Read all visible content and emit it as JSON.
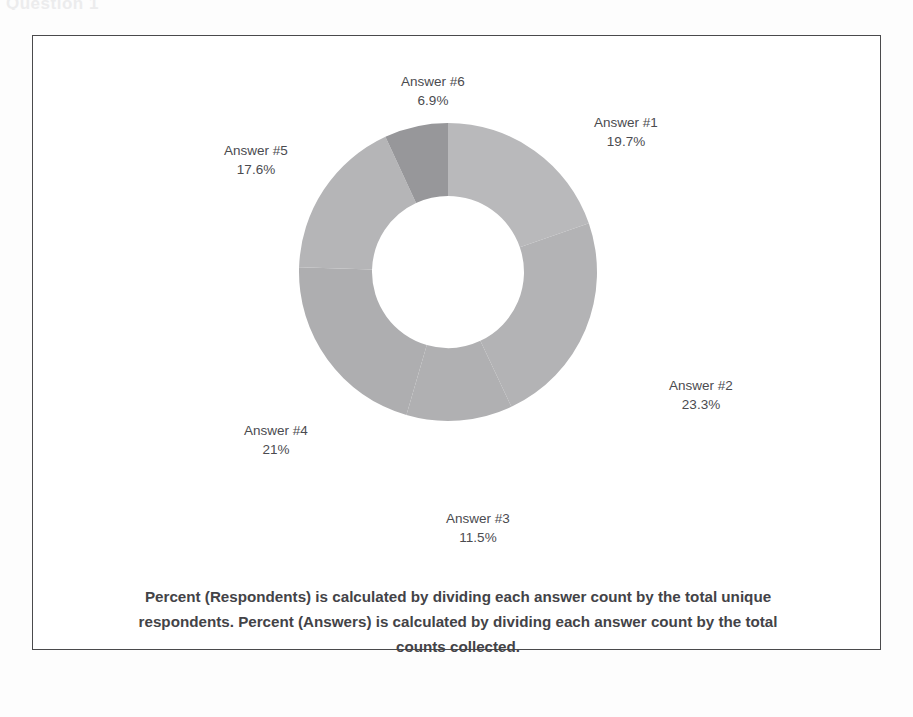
{
  "document": {
    "header_fragment": "Question 1"
  },
  "chart_data": {
    "type": "pie",
    "variant": "donut",
    "title": "",
    "xlabel": "",
    "ylabel": "",
    "legend_position": "none",
    "grid": false,
    "start_angle_deg": 0,
    "direction": "clockwise",
    "categories": [
      "Answer #1",
      "Answer #2",
      "Answer #3",
      "Answer #4",
      "Answer #5",
      "Answer #6"
    ],
    "values": [
      19.7,
      23.3,
      11.5,
      21,
      17.6,
      6.9
    ],
    "value_labels": [
      "19.7%",
      "23.3%",
      "11.5%",
      "21%",
      "17.6%",
      "6.9%"
    ],
    "unit": "%",
    "total": 100,
    "colors": [
      "#b9b9bb",
      "#b3b3b5",
      "#b0b0b2",
      "#aeaeb0",
      "#b5b5b7",
      "#97979a"
    ],
    "slices": [
      {
        "label": "Answer #1",
        "value": 19.7,
        "value_label": "19.7%",
        "color": "#b9b9bb"
      },
      {
        "label": "Answer #2",
        "value": 23.3,
        "value_label": "23.3%",
        "color": "#b3b3b5"
      },
      {
        "label": "Answer #3",
        "value": 11.5,
        "value_label": "11.5%",
        "color": "#b0b0b2"
      },
      {
        "label": "Answer #4",
        "value": 21,
        "value_label": "21%",
        "color": "#aeaeb0"
      },
      {
        "label": "Answer #5",
        "value": 17.6,
        "value_label": "17.6%",
        "color": "#b5b5b7"
      },
      {
        "label": "Answer #6",
        "value": 6.9,
        "value_label": "6.9%",
        "color": "#97979a"
      }
    ]
  },
  "caption": {
    "line1": "Percent (Respondents) is calculated by dividing each answer count by the",
    "line2": "total unique respondents. Percent (Answers) is calculated by dividing each",
    "line3": "answer count by the total counts collected."
  }
}
